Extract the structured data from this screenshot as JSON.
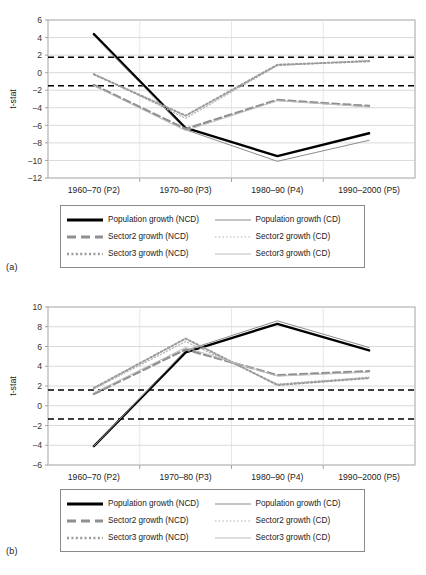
{
  "figure": {
    "panel_a_label": "(a)",
    "panel_b_label": "(b)"
  },
  "legend": {
    "items": [
      {
        "label": "Population growth (NCD)",
        "key": "solid-thick-black",
        "color": "#000000"
      },
      {
        "label": "Population growth (CD)",
        "key": "solid-thin-gray",
        "color": "#808080"
      },
      {
        "label": "Sector2 growth (NCD)",
        "key": "dashed-thick-gray",
        "color": "#808080"
      },
      {
        "label": "Sector2 growth (CD)",
        "key": "dotted-thin-gray",
        "color": "#a8a8a8"
      },
      {
        "label": "Sector3 growth (NCD)",
        "key": "dotted-thick-gray",
        "color": "#9a9a9a"
      },
      {
        "label": "Sector3 growth (CD)",
        "key": "solid-thin-lightgray",
        "color": "#b5b5b5"
      }
    ]
  },
  "chart_data": [
    {
      "type": "line",
      "panel": "(a)",
      "title": "",
      "xlabel": "",
      "ylabel": "t-stat",
      "categories": [
        "1960–70 (P2)",
        "1970–80 (P3)",
        "1980–90 (P4)",
        "1990–2000 (P5)"
      ],
      "ylim": [
        -12,
        6
      ],
      "yticks": [
        6,
        4,
        2,
        0,
        -2,
        -4,
        -6,
        -8,
        -10,
        -12
      ],
      "grid": true,
      "legend_position": "below",
      "threshold_lines": [
        {
          "value": 1.75,
          "style": "dashed",
          "color": "#000000"
        },
        {
          "value": -1.5,
          "style": "dashed",
          "color": "#000000"
        }
      ],
      "series": [
        {
          "name": "Population growth (NCD)",
          "values": [
            4.4,
            -6.3,
            -9.5,
            -6.9
          ]
        },
        {
          "name": "Population growth (CD)",
          "values": [
            4.2,
            -6.5,
            -10.1,
            -7.7
          ]
        },
        {
          "name": "Sector2 growth (NCD)",
          "values": [
            -1.4,
            -6.4,
            -3.1,
            -3.8
          ]
        },
        {
          "name": "Sector2 growth (CD)",
          "values": [
            -0.1,
            -5.2,
            0.8,
            1.4
          ]
        },
        {
          "name": "Sector3 growth (NCD)",
          "values": [
            -0.2,
            -4.9,
            0.9,
            1.3
          ]
        },
        {
          "name": "Sector3 growth (CD)",
          "values": [
            -1.5,
            -6.6,
            -3.2,
            -3.9
          ]
        }
      ]
    },
    {
      "type": "line",
      "panel": "(b)",
      "title": "",
      "xlabel": "",
      "ylabel": "t-stat",
      "categories": [
        "1960–70 (P2)",
        "1970–80 (P3)",
        "1980–90 (P4)",
        "1990–2000 (P5)"
      ],
      "ylim": [
        -6,
        10
      ],
      "yticks": [
        10,
        8,
        6,
        4,
        2,
        0,
        -2,
        -4,
        -6
      ],
      "grid": true,
      "legend_position": "below",
      "threshold_lines": [
        {
          "value": 1.6,
          "style": "dashed",
          "color": "#000000"
        },
        {
          "value": -1.35,
          "style": "dashed",
          "color": "#000000"
        }
      ],
      "series": [
        {
          "name": "Population growth (NCD)",
          "values": [
            -4.1,
            5.4,
            8.3,
            5.6
          ]
        },
        {
          "name": "Population growth (CD)",
          "values": [
            -4.1,
            5.6,
            8.6,
            5.9
          ]
        },
        {
          "name": "Sector2 growth (NCD)",
          "values": [
            1.2,
            5.7,
            3.1,
            3.5
          ]
        },
        {
          "name": "Sector2 growth (CD)",
          "values": [
            1.7,
            6.5,
            2.2,
            2.9
          ]
        },
        {
          "name": "Sector3 growth (NCD)",
          "values": [
            1.8,
            6.8,
            2.1,
            2.8
          ]
        },
        {
          "name": "Sector3 growth (CD)",
          "values": [
            1.3,
            5.9,
            3.0,
            3.4
          ]
        }
      ]
    }
  ]
}
